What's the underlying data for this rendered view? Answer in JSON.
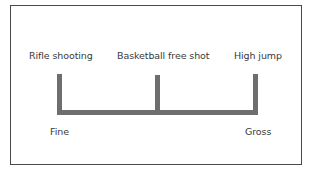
{
  "diagram": {
    "title": "",
    "top_labels": [
      {
        "text": "Rifle shooting"
      },
      {
        "text": "Basketball free shot"
      },
      {
        "text": "High jump"
      }
    ],
    "bottom_labels": {
      "left": "Fine",
      "right": "Gross"
    },
    "colors": {
      "bar": "#6e6e6e",
      "border": "#4a4a4a",
      "text": "#3a3a3a",
      "background": "#ffffff"
    }
  }
}
